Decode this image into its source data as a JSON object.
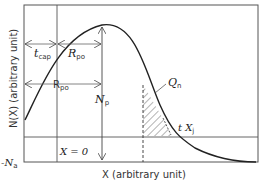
{
  "diagram": {
    "type": "doping-profile",
    "xlabel": "X (arbitrary unit)",
    "ylabel": "N(X) (arbitrary unit)",
    "y_baseline_label": "-N",
    "y_baseline_sub": "a",
    "x0_label": "X = 0",
    "labels": {
      "tcap_main": "t",
      "tcap_sub": "cap",
      "rpo1_main": "R",
      "rpo1_sub": "po",
      "rpo2_main": "R",
      "rpo2_sub": "po",
      "np_main": "N",
      "np_sub": "p",
      "qn_main": "Q",
      "qn_sub": "n",
      "xj_main": "t X",
      "xj_sub": "j"
    },
    "colors": {
      "line": "#222222",
      "frame": "#555555",
      "hatch": "#444444"
    }
  }
}
